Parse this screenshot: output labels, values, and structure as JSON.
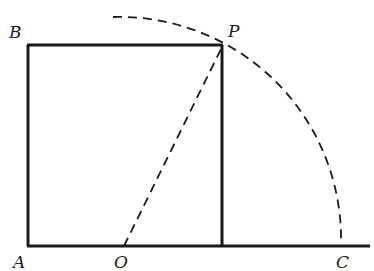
{
  "diagram": {
    "labels": {
      "A": "A",
      "B": "B",
      "P": "P",
      "O": "O",
      "C": "C"
    },
    "points": {
      "A": [
        28,
        246
      ],
      "B": [
        28,
        45
      ],
      "P": [
        222,
        45
      ],
      "foot": [
        222,
        246
      ],
      "O": [
        124,
        246
      ],
      "C": [
        341,
        246
      ],
      "baseline_end": [
        370,
        246
      ]
    },
    "colors": {
      "stroke": "#1a1a1a",
      "background": "#ffffff"
    }
  }
}
